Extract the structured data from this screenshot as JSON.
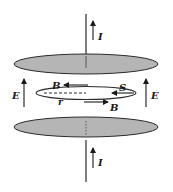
{
  "diagram": {
    "labels": {
      "current_top": "I",
      "current_bottom": "I",
      "field_left": "E",
      "field_right": "E",
      "magnetic_top": "B",
      "magnetic_bottom": "B",
      "surface": "S",
      "radius": "r"
    },
    "colors": {
      "plate_fill": "#b5b5b5",
      "stroke": "#2a2a2a",
      "background": "#ffffff"
    }
  }
}
